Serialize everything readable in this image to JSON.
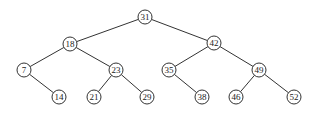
{
  "diagram": {
    "type": "binary-search-tree",
    "nodes": [
      {
        "id": "n31",
        "label": "31",
        "x": 145,
        "y": 17
      },
      {
        "id": "n18",
        "label": "18",
        "x": 70,
        "y": 44
      },
      {
        "id": "n42",
        "label": "42",
        "x": 214,
        "y": 43
      },
      {
        "id": "n7",
        "label": "7",
        "x": 24,
        "y": 70
      },
      {
        "id": "n23",
        "label": "23",
        "x": 116,
        "y": 70
      },
      {
        "id": "n35",
        "label": "35",
        "x": 169,
        "y": 70
      },
      {
        "id": "n49",
        "label": "49",
        "x": 259,
        "y": 70
      },
      {
        "id": "n14",
        "label": "14",
        "x": 59,
        "y": 97
      },
      {
        "id": "n21",
        "label": "21",
        "x": 94,
        "y": 97
      },
      {
        "id": "n29",
        "label": "29",
        "x": 147,
        "y": 97
      },
      {
        "id": "n38",
        "label": "38",
        "x": 202,
        "y": 97
      },
      {
        "id": "n46",
        "label": "46",
        "x": 236,
        "y": 97
      },
      {
        "id": "n52",
        "label": "52",
        "x": 294,
        "y": 97
      }
    ],
    "edges": [
      [
        "n31",
        "n18"
      ],
      [
        "n31",
        "n42"
      ],
      [
        "n18",
        "n7"
      ],
      [
        "n18",
        "n23"
      ],
      [
        "n42",
        "n35"
      ],
      [
        "n42",
        "n49"
      ],
      [
        "n7",
        "n14"
      ],
      [
        "n23",
        "n21"
      ],
      [
        "n23",
        "n29"
      ],
      [
        "n35",
        "n38"
      ],
      [
        "n49",
        "n46"
      ],
      [
        "n49",
        "n52"
      ]
    ],
    "node_radius": 7
  }
}
